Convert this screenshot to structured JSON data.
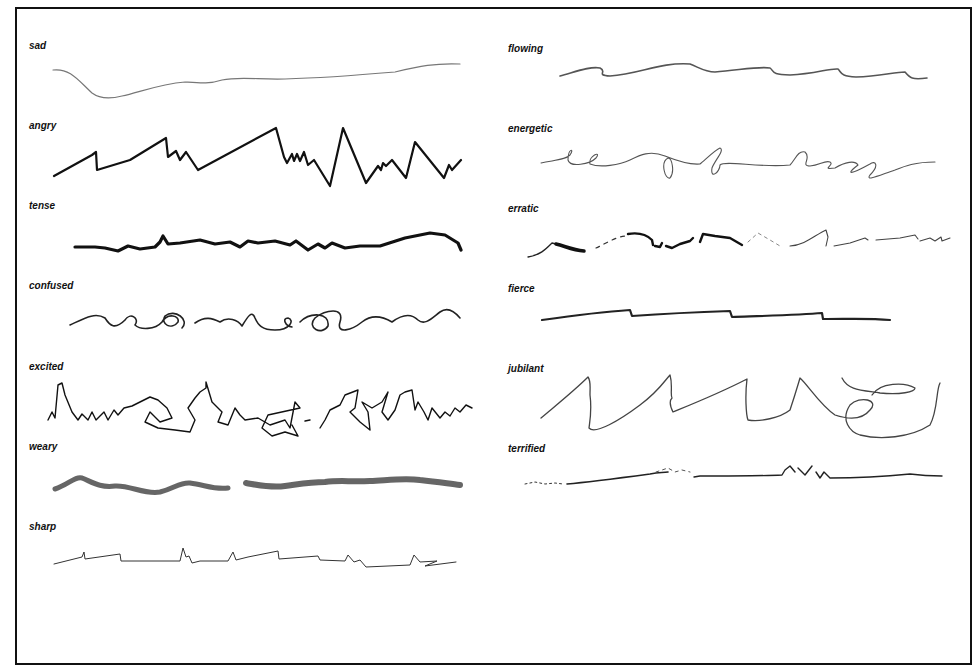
{
  "figure": {
    "left_column": [
      {
        "label": "sad",
        "x": 29,
        "y": 40
      },
      {
        "label": "angry",
        "x": 29,
        "y": 120
      },
      {
        "label": "tense",
        "x": 29,
        "y": 200
      },
      {
        "label": "confused",
        "x": 29,
        "y": 280
      },
      {
        "label": "excited",
        "x": 29,
        "y": 361
      },
      {
        "label": "weary",
        "x": 29,
        "y": 441
      },
      {
        "label": "sharp",
        "x": 29,
        "y": 521
      }
    ],
    "right_column": [
      {
        "label": "flowing",
        "x": 508,
        "y": 43
      },
      {
        "label": "energetic",
        "x": 508,
        "y": 123
      },
      {
        "label": "erratic",
        "x": 508,
        "y": 203
      },
      {
        "label": "fierce",
        "x": 508,
        "y": 283
      },
      {
        "label": "jubilant",
        "x": 508,
        "y": 363
      },
      {
        "label": "terrified",
        "x": 508,
        "y": 443
      }
    ]
  },
  "colors": {
    "frame": "#111111",
    "ink": "#1a1a1a",
    "background": "#ffffff"
  }
}
